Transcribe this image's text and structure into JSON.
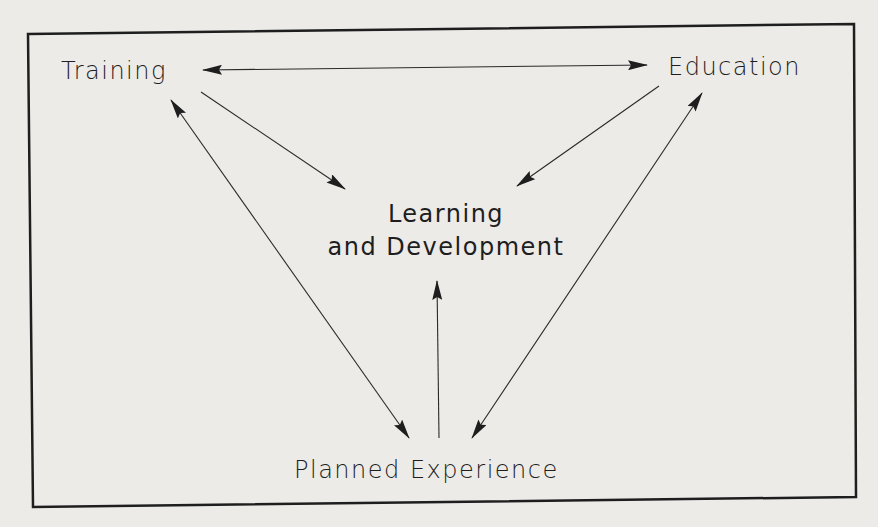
{
  "diagram": {
    "nodes": {
      "training": {
        "label": "Training"
      },
      "education": {
        "label": "Education"
      },
      "learning": {
        "line1": "Learning",
        "line2": "and Development"
      },
      "planned": {
        "label": "Planned Experience"
      }
    },
    "edges": [
      {
        "from": "Training",
        "to": "Education",
        "direction": "both"
      },
      {
        "from": "Training",
        "to": "Learning and Development",
        "direction": "forward"
      },
      {
        "from": "Education",
        "to": "Learning and Development",
        "direction": "forward"
      },
      {
        "from": "Planned Experience",
        "to": "Training",
        "direction": "both"
      },
      {
        "from": "Planned Experience",
        "to": "Education",
        "direction": "both"
      },
      {
        "from": "Planned Experience",
        "to": "Learning and Development",
        "direction": "forward"
      }
    ],
    "colors": {
      "ink": "#1e1e1e",
      "paper": "#ecebe8"
    }
  }
}
